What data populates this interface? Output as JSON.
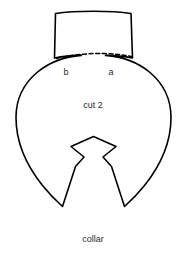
{
  "diagram": {
    "title": "collar",
    "labels": {
      "point_left": "b",
      "point_right": "a",
      "quantity": "cut 2",
      "piece_name": "collar"
    },
    "colors": {
      "line": "#000000",
      "background": "#ffffff",
      "text": "#2b2b2b"
    },
    "shapes": {
      "body_outline": "circular collar piece with neck flap and V notch",
      "fold_line": "dashed arc between point b and point a",
      "notch": "diamond notch with V wedge opening at bottom"
    }
  }
}
